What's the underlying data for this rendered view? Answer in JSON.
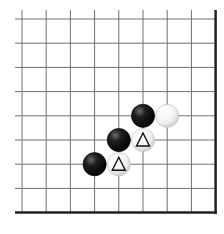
{
  "board": {
    "type": "go-board-corner-fragment",
    "columns": 9,
    "rows": 9,
    "grid_origin_x": 22,
    "grid_origin_y": 19,
    "spacing": 24.2,
    "edges": [
      "right",
      "bottom"
    ],
    "line_color": "#707070",
    "edge_color": "#222222",
    "background": "#ffffff"
  },
  "stones": [
    {
      "color": "black",
      "col": 5,
      "row": 4,
      "marker": ""
    },
    {
      "color": "white",
      "col": 6,
      "row": 4,
      "marker": ""
    },
    {
      "color": "black",
      "col": 4,
      "row": 5,
      "marker": ""
    },
    {
      "color": "white",
      "col": 5,
      "row": 5,
      "marker": "triangle"
    },
    {
      "color": "black",
      "col": 3,
      "row": 6,
      "marker": ""
    },
    {
      "color": "white",
      "col": 4,
      "row": 6,
      "marker": "triangle"
    }
  ]
}
